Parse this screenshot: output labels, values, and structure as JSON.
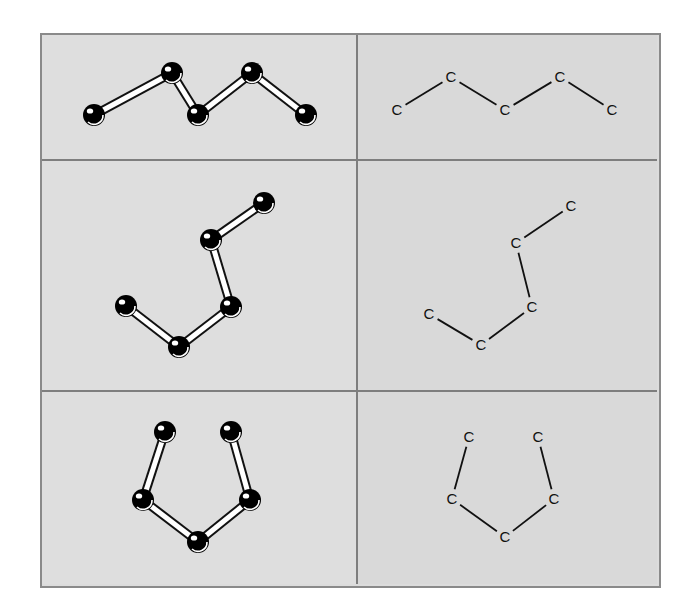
{
  "figure": {
    "rows": [
      {
        "name": "zigzag",
        "ball_and_stick": {
          "atoms": [
            [
              94,
              115
            ],
            [
              172,
              73
            ],
            [
              198,
              115
            ],
            [
              252,
              73
            ],
            [
              306,
              115
            ]
          ]
        },
        "skeletal": {
          "labels": [
            "C",
            "C",
            "C",
            "C",
            "C"
          ],
          "atoms": [
            [
              397,
              110
            ],
            [
              451,
              77
            ],
            [
              505,
              110
            ],
            [
              560,
              77
            ],
            [
              612,
              110
            ]
          ]
        }
      },
      {
        "name": "bent",
        "ball_and_stick": {
          "atoms": [
            [
              126,
              306
            ],
            [
              179,
              347
            ],
            [
              231,
              307
            ],
            [
              211,
              240
            ],
            [
              264,
              203
            ]
          ]
        },
        "skeletal": {
          "labels": [
            "C",
            "C",
            "C",
            "C",
            "C"
          ],
          "atoms": [
            [
              429,
              314
            ],
            [
              481,
              345
            ],
            [
              532,
              307
            ],
            [
              516,
              243
            ],
            [
              571,
              206
            ]
          ]
        }
      },
      {
        "name": "ring-like",
        "ball_and_stick": {
          "atoms": [
            [
              165,
              432
            ],
            [
              143,
              500
            ],
            [
              198,
              542
            ],
            [
              250,
              500
            ],
            [
              231,
              432
            ]
          ]
        },
        "skeletal": {
          "labels": [
            "C",
            "C",
            "C",
            "C",
            "C"
          ],
          "atoms": [
            [
              469,
              437
            ],
            [
              452,
              499
            ],
            [
              505,
              537
            ],
            [
              554,
              499
            ],
            [
              538,
              437
            ]
          ]
        }
      }
    ],
    "colors": {
      "background": "#dcdcdc",
      "grid_line": "#7e7e7e",
      "atom": "#111111",
      "bond_fill": "#ffffff",
      "label": "#111111"
    }
  }
}
